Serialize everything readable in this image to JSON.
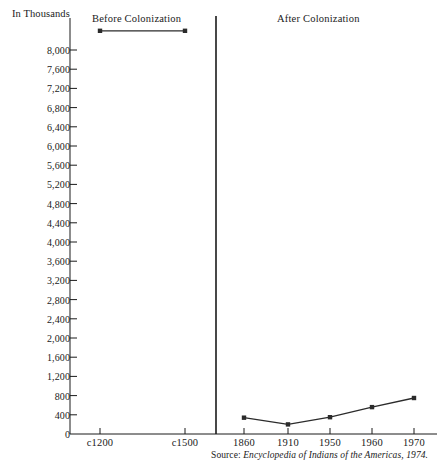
{
  "chart_data": {
    "type": "line",
    "title": "",
    "unit_label": "In Thousands",
    "xlabel": "",
    "ylabel": "In Thousands",
    "ylim": [
      0,
      8400
    ],
    "grid": false,
    "legend": "none",
    "panels": [
      {
        "name": "before",
        "label": "Before Colonization",
        "categories": [
          "c1200",
          "c1500"
        ],
        "values": [
          8400,
          8400
        ]
      },
      {
        "name": "after",
        "label": "After Colonization",
        "categories": [
          "1860",
          "1910",
          "1950",
          "1960",
          "1970"
        ],
        "values": [
          340,
          200,
          350,
          560,
          750
        ]
      }
    ],
    "x_tick_labels": [
      "c1200",
      "c1500",
      "1860",
      "1910",
      "1950",
      "1960",
      "1970"
    ],
    "y_tick_labels": [
      "8,000",
      "7,600",
      "7,200",
      "6,800",
      "6,400",
      "6,000",
      "5,600",
      "5,200",
      "4,800",
      "4,400",
      "4,000",
      "3,600",
      "3,200",
      "2,800",
      "2,400",
      "2,000",
      "1,600",
      "1,200",
      "800",
      "400",
      "0"
    ],
    "y_tick_values": [
      8000,
      7600,
      7200,
      6800,
      6400,
      6000,
      5600,
      5200,
      4800,
      4400,
      4000,
      3600,
      3200,
      2800,
      2400,
      2000,
      1600,
      1200,
      800,
      400,
      0
    ],
    "y_tick_step": 400,
    "annotations": {
      "divider": "panel-divider"
    },
    "source": {
      "prefix": "Source: ",
      "text": "Encyclopedia of Indians of the Americas, 1974."
    },
    "colors": {
      "ink": "#1a1a1a",
      "line": "#2b2b2b",
      "axis": "#1a1a1a",
      "background": "#ffffff"
    }
  }
}
